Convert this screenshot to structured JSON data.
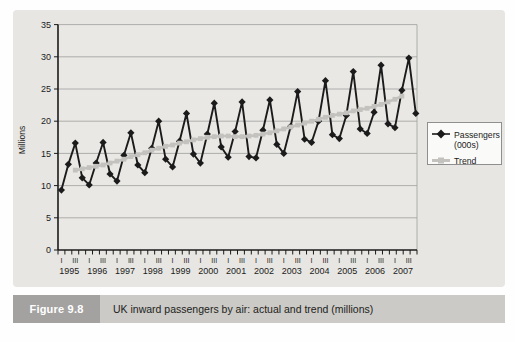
{
  "figure": {
    "label": "Figure 9.8",
    "caption": "UK inward passengers by air: actual and trend (millions)"
  },
  "chart_data": {
    "type": "line",
    "title": "",
    "xlabel": "",
    "ylabel": "Millions",
    "ylim": [
      0,
      35
    ],
    "yticks": [
      0,
      5,
      10,
      15,
      20,
      25,
      30,
      35
    ],
    "grid": true,
    "legend_position": "right-outside",
    "x_unit": "quarter",
    "years": [
      1995,
      1996,
      1997,
      1998,
      1999,
      2000,
      2001,
      2002,
      2003,
      2004,
      2005,
      2006,
      2007
    ],
    "quarter_tick_labels": [
      "I",
      "",
      "III",
      ""
    ],
    "series": [
      {
        "name": "Passengers (000s)",
        "legend_lines": [
          "Passengers",
          "(000s)"
        ],
        "color": "#1b1b1b",
        "marker": "diamond",
        "start_index": 0,
        "values": [
          9.3,
          13.3,
          16.6,
          11.2,
          10.1,
          13.5,
          16.7,
          11.8,
          10.7,
          14.7,
          18.2,
          13.2,
          12.0,
          15.8,
          20.0,
          14.1,
          12.9,
          16.9,
          21.2,
          14.9,
          13.5,
          18.0,
          22.8,
          16.0,
          14.4,
          18.4,
          23.0,
          14.5,
          14.3,
          18.6,
          23.3,
          16.4,
          15.0,
          19.2,
          24.6,
          17.2,
          16.7,
          20.0,
          26.3,
          17.9,
          17.3,
          20.9,
          27.7,
          18.8,
          18.1,
          21.4,
          28.7,
          19.6,
          19.0,
          24.8,
          29.8,
          21.2
        ]
      },
      {
        "name": "Trend",
        "legend_lines": [
          "Trend"
        ],
        "color": "#c3c2bf",
        "marker": "square",
        "start_index": 2,
        "values": [
          12.4,
          12.6,
          12.8,
          13.0,
          13.2,
          13.5,
          13.8,
          14.1,
          14.5,
          14.8,
          15.1,
          15.5,
          15.8,
          16.1,
          16.3,
          16.6,
          16.8,
          17.1,
          17.3,
          17.5,
          17.6,
          17.7,
          17.7,
          17.6,
          17.6,
          17.7,
          17.8,
          18.0,
          18.2,
          18.5,
          18.8,
          19.1,
          19.4,
          19.7,
          20.0,
          20.3,
          20.6,
          20.9,
          21.1,
          21.3,
          21.6,
          21.8,
          22.0,
          22.3,
          22.6,
          23.0,
          23.4,
          23.9
        ]
      }
    ]
  },
  "colors": {
    "panel_bg": "#e7e6e2",
    "plot_bg": "#e9e8e4",
    "gridline": "#9e9e9e",
    "axis": "#1b1b1b",
    "tick_text": "#1b1b1b",
    "figure_label_bg": "#a3a2a0",
    "caption_bar_bg": "#cbcac6",
    "legend_bg": "#fafaf8",
    "legend_border": "#8f8f8f"
  }
}
